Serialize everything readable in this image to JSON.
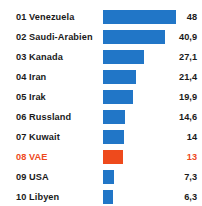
{
  "chart_data": {
    "type": "bar",
    "title": "",
    "subtitle": "",
    "xlabel": "",
    "ylabel": "",
    "orientation": "horizontal",
    "grid": false,
    "legend": false,
    "xlim": [
      0,
      48
    ],
    "decimal_separator": ",",
    "bar_color": "#2176c7",
    "highlight_color": "#ee4a1c",
    "text_color": "#1a1a1a",
    "background_color": "#ffffff",
    "categories": [
      "Venezuela",
      "Saudi-Arabien",
      "Kanada",
      "Iran",
      "Irak",
      "Russland",
      "Kuwait",
      "VAE",
      "USA",
      "Libyen"
    ],
    "values": [
      48,
      40.9,
      27.1,
      21.4,
      19.9,
      14.6,
      14,
      13,
      7.3,
      6.3
    ],
    "value_labels": [
      "48",
      "40,9",
      "27,1",
      "21,4",
      "19,9",
      "14,6",
      "14",
      "13",
      "7,3",
      "6,3"
    ],
    "ranks": [
      "01",
      "02",
      "03",
      "04",
      "05",
      "06",
      "07",
      "08",
      "09",
      "10"
    ],
    "highlight_index": 7,
    "rows": [
      {
        "rank": "01",
        "name": "Venezuela",
        "value": 48,
        "value_label": "48",
        "highlight": false
      },
      {
        "rank": "02",
        "name": "Saudi-Arabien",
        "value": 40.9,
        "value_label": "40,9",
        "highlight": false
      },
      {
        "rank": "03",
        "name": "Kanada",
        "value": 27.1,
        "value_label": "27,1",
        "highlight": false
      },
      {
        "rank": "04",
        "name": "Iran",
        "value": 21.4,
        "value_label": "21,4",
        "highlight": false
      },
      {
        "rank": "05",
        "name": "Irak",
        "value": 19.9,
        "value_label": "19,9",
        "highlight": false
      },
      {
        "rank": "06",
        "name": "Russland",
        "value": 14.6,
        "value_label": "14,6",
        "highlight": false
      },
      {
        "rank": "07",
        "name": "Kuwait",
        "value": 14,
        "value_label": "14",
        "highlight": false
      },
      {
        "rank": "08",
        "name": "VAE",
        "value": 13,
        "value_label": "13",
        "highlight": true
      },
      {
        "rank": "09",
        "name": "USA",
        "value": 7.3,
        "value_label": "7,3",
        "highlight": false
      },
      {
        "rank": "10",
        "name": "Libyen",
        "value": 6.3,
        "value_label": "6,3",
        "highlight": false
      }
    ]
  },
  "layout": {
    "row_pitch": 20,
    "first_row_top": 7,
    "bar_left": 103,
    "bar_max_width": 73
  }
}
